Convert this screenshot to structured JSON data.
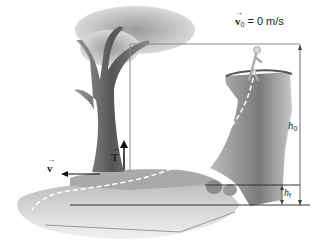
{
  "diagram": {
    "type": "physics-illustration",
    "labels": {
      "v0": {
        "symbol": "v",
        "subscript": "0",
        "equals": "= 0 m/s"
      },
      "tension": {
        "symbol": "T"
      },
      "v_bottom": {
        "symbol": "v"
      },
      "h0": {
        "symbol": "h",
        "subscript": "0"
      },
      "h1": {
        "symbol": "h",
        "subscript": "f"
      }
    },
    "elements": [
      "tree",
      "rope-pivot-vertical-line",
      "cliff",
      "person-at-cliff-top",
      "dashed-trajectory",
      "water",
      "rocks",
      "height-dimension-h0",
      "height-dimension-hf"
    ],
    "colors": {
      "ink": "#222222",
      "guide_line": "#8a8a8a",
      "tree": "#6e6e6e",
      "foliage": "#b9b9b9",
      "cliff": "#8c8c8c",
      "water": "#cfcfcf",
      "ground": "#a9a9a9"
    }
  }
}
